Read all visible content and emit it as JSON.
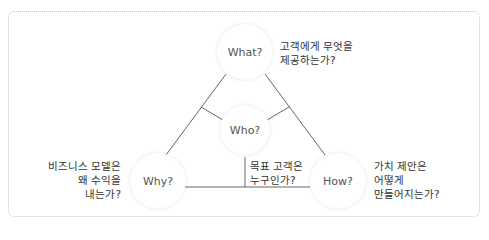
{
  "diagram": {
    "title": "",
    "nodes": [
      {
        "id": "what",
        "label": "What?",
        "description": [
          "고객에게 무엇을",
          "제공하는가?"
        ]
      },
      {
        "id": "who",
        "label": "Who?",
        "description": [
          "목표 고객은",
          "누구인가?"
        ]
      },
      {
        "id": "why",
        "label": "Why?",
        "description": [
          "비즈니스 모델은",
          "왜 수익을",
          "내는가?"
        ]
      },
      {
        "id": "how",
        "label": "How?",
        "description": [
          "가치 제안은",
          "어떻게",
          "만들어지는가?"
        ]
      }
    ],
    "edges": [
      {
        "from": "what",
        "to": "why"
      },
      {
        "from": "what",
        "to": "how"
      },
      {
        "from": "why",
        "to": "how"
      },
      {
        "from": "who",
        "to": "what-why-edge"
      },
      {
        "from": "who",
        "to": "what-how-edge"
      },
      {
        "from": "who",
        "to": "why-how-edge"
      }
    ],
    "colors": {
      "line": "#555555",
      "circle_fill": "#ffffff",
      "border": "#c8c8c8"
    }
  }
}
